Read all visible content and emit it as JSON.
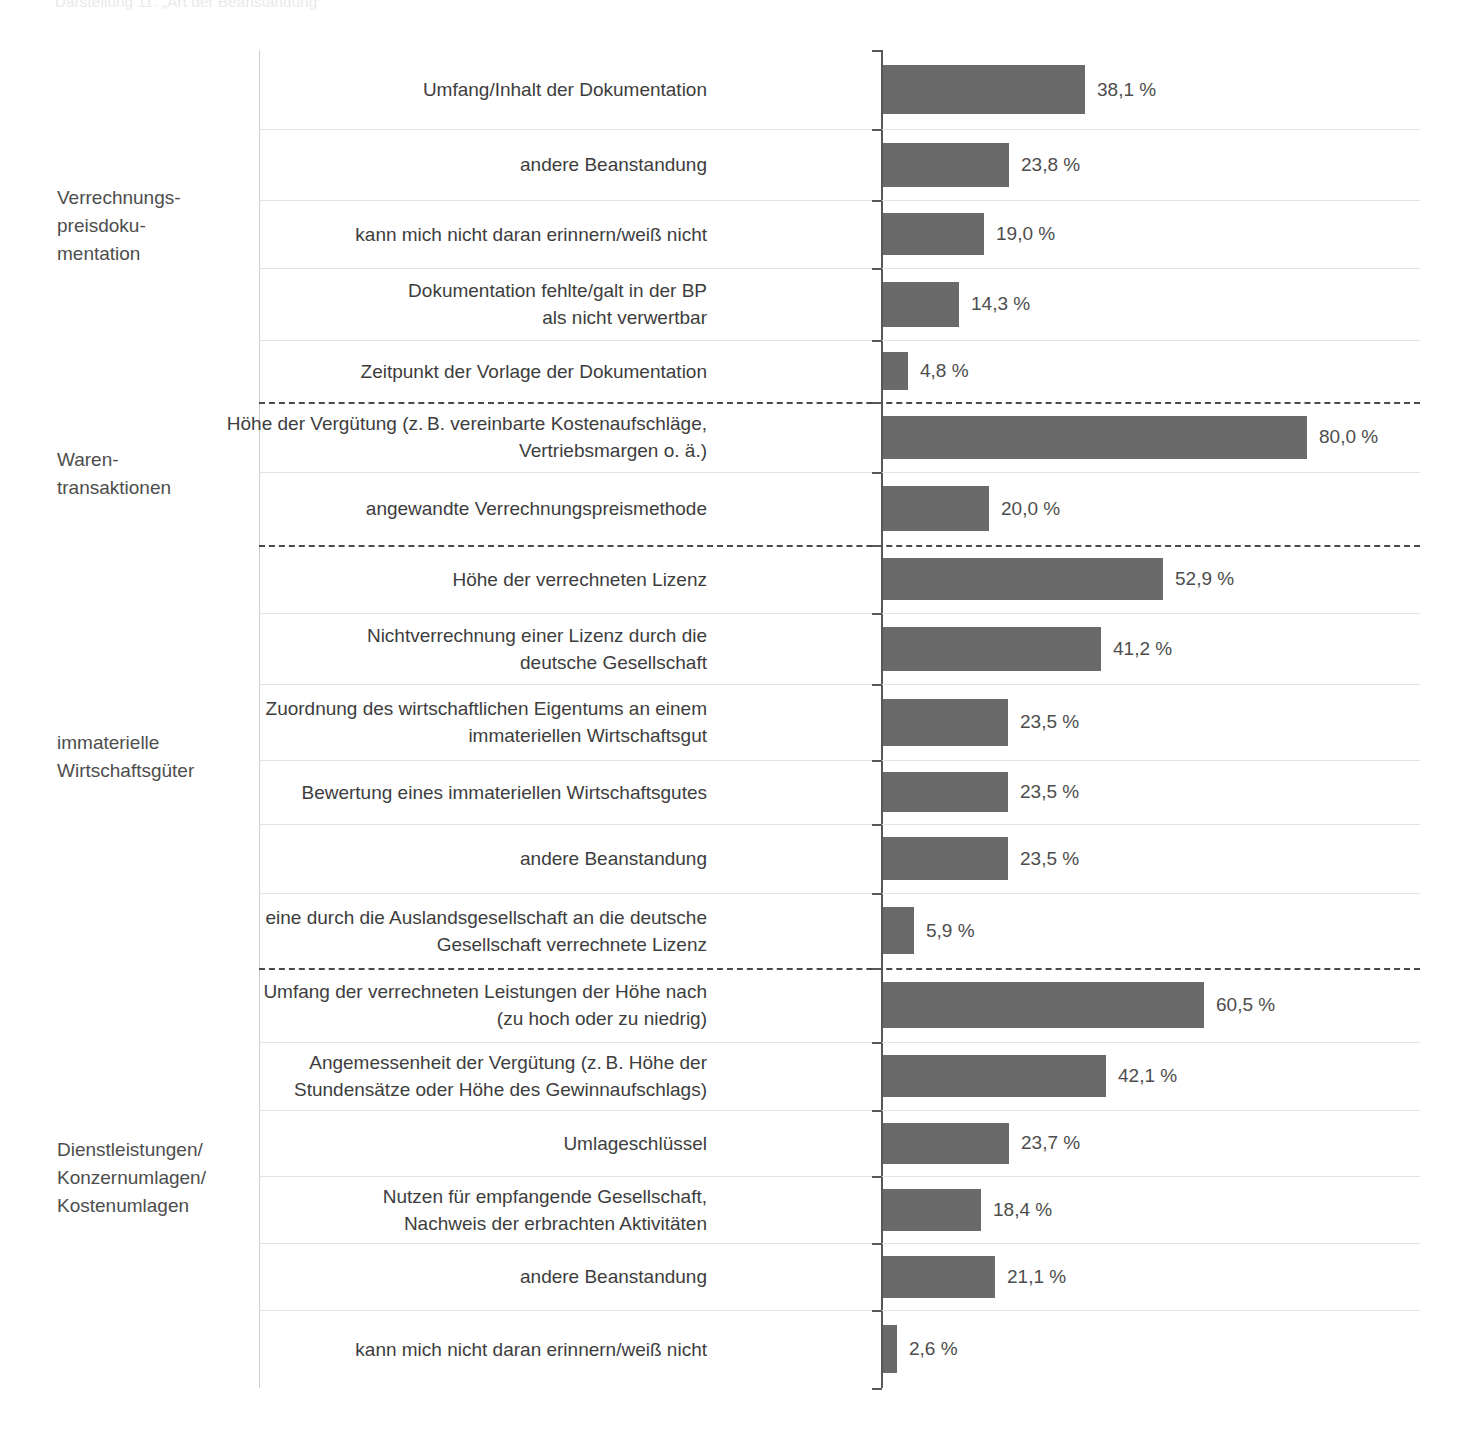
{
  "caption": "Darstellung 11:  „Art der Beanstandung“",
  "colors": {
    "bar": "#6a6a6a",
    "axis": "#585858",
    "grid": "#e3e3e3",
    "group_divider": "#4a4a4a",
    "text": "#3d3d3d"
  },
  "chart_data": {
    "type": "bar",
    "orientation": "horizontal",
    "title": "",
    "xlabel": "",
    "ylabel": "",
    "xlim": [
      0,
      85
    ],
    "grid": true,
    "legend": false,
    "value_suffix": " %",
    "decimal_separator": ",",
    "groups": [
      {
        "name": "Verrechnungs-\npreisdoku-\nmentation",
        "name_lines": [
          "Verrechnungs-",
          "preisdoku-",
          "mentation"
        ],
        "categories": [
          "Umfang/Inhalt der Dokumentation",
          "andere Beanstandung",
          "kann mich nicht daran erinnern/weiß nicht",
          "Dokumentation fehlte/galt in der BP\nals nicht verwertbar",
          "Zeitpunkt der Vorlage der Dokumentation"
        ],
        "category_lines": [
          [
            "Umfang/Inhalt der Dokumentation"
          ],
          [
            "andere Beanstandung"
          ],
          [
            "kann mich nicht daran erinnern/weiß nicht"
          ],
          [
            "Dokumentation fehlte/galt in der BP",
            "als nicht verwertbar"
          ],
          [
            "Zeitpunkt der Vorlage der Dokumentation"
          ]
        ],
        "values": [
          38.1,
          23.8,
          19.0,
          14.3,
          4.8
        ],
        "labels": [
          "38,1 %",
          "23,8 %",
          "19,0 %",
          "14,3 %",
          "4,8 %"
        ]
      },
      {
        "name": "Waren-\ntransaktionen",
        "name_lines": [
          "Waren-",
          "transaktionen"
        ],
        "categories": [
          "Höhe der Vergütung (z. B. vereinbarte Kostenaufschläge,\nVertriebsmargen o. ä.)",
          "angewandte Verrechnungspreismethode"
        ],
        "category_lines": [
          [
            "Höhe der Vergütung (z. B. vereinbarte Kostenaufschläge,",
            "Vertriebsmargen o. ä.)"
          ],
          [
            "angewandte Verrechnungspreismethode"
          ]
        ],
        "values": [
          80.0,
          20.0
        ],
        "labels": [
          "80,0 %",
          "20,0 %"
        ]
      },
      {
        "name": "immaterielle\nWirtschaftsgüter",
        "name_lines": [
          "immaterielle",
          "Wirtschaftsgüter"
        ],
        "categories": [
          "Höhe der verrechneten Lizenz",
          "Nichtverrechnung einer Lizenz durch die\ndeutsche Gesellschaft",
          "Zuordnung des wirtschaftlichen Eigentums an einem\nimmateriellen Wirtschaftsgut",
          "Bewertung eines immateriellen Wirtschaftsgutes",
          "andere Beanstandung",
          "eine durch die Auslandsgesellschaft an die deutsche\nGesellschaft verrechnete Lizenz"
        ],
        "category_lines": [
          [
            "Höhe der verrechneten Lizenz"
          ],
          [
            "Nichtverrechnung einer Lizenz durch die",
            "deutsche Gesellschaft"
          ],
          [
            "Zuordnung des wirtschaftlichen Eigentums an einem",
            "immateriellen Wirtschaftsgut"
          ],
          [
            "Bewertung eines immateriellen Wirtschaftsgutes"
          ],
          [
            "andere Beanstandung"
          ],
          [
            "eine durch die Auslandsgesellschaft an die deutsche",
            "Gesellschaft verrechnete Lizenz"
          ]
        ],
        "values": [
          52.9,
          41.2,
          23.5,
          23.5,
          23.5,
          5.9
        ],
        "labels": [
          "52,9 %",
          "41,2 %",
          "23,5 %",
          "23,5 %",
          "23,5 %",
          "5,9 %"
        ]
      },
      {
        "name": "Dienstleistungen/\nKonzernumlagen/\nKostenumlagen",
        "name_lines": [
          "Dienstleistungen/",
          "Konzernumlagen/",
          "Kostenumlagen"
        ],
        "categories": [
          "Umfang der verrechneten Leistungen der Höhe nach\n(zu hoch oder zu niedrig)",
          "Angemessenheit der Vergütung (z. B. Höhe der\nStundensätze oder Höhe des Gewinnaufschlags)",
          "Umlageschlüssel",
          "Nutzen für empfangende Gesellschaft,\nNachweis der erbrachten Aktivitäten",
          "andere Beanstandung",
          "kann mich nicht daran erinnern/weiß nicht"
        ],
        "category_lines": [
          [
            "Umfang der verrechneten Leistungen der Höhe nach",
            "(zu hoch oder zu niedrig)"
          ],
          [
            "Angemessenheit der Vergütung (z. B. Höhe der",
            "Stundensätze oder Höhe des Gewinnaufschlags)"
          ],
          [
            "Umlageschlüssel"
          ],
          [
            "Nutzen für empfangende Gesellschaft,",
            "Nachweis der erbrachten Aktivitäten"
          ],
          [
            "andere Beanstandung"
          ],
          [
            "kann mich nicht daran erinnern/weiß nicht"
          ]
        ],
        "values": [
          60.5,
          42.1,
          23.7,
          18.4,
          21.1,
          2.6
        ],
        "labels": [
          "60,5 %",
          "42,1 %",
          "23,7 %",
          "18,4 %",
          "21,1 %",
          "2,6 %"
        ]
      }
    ]
  },
  "layout": {
    "axis_x": 881,
    "px_per_percent": 5.3,
    "chart_top": 50,
    "chart_bottom": 1388,
    "row_boundaries": [
      50,
      129,
      200,
      268,
      340,
      402,
      472,
      545,
      613,
      684,
      760,
      824,
      893,
      968,
      1042,
      1110,
      1176,
      1243,
      1310,
      1388
    ],
    "group_end_indices": [
      5,
      7,
      13,
      19
    ]
  }
}
